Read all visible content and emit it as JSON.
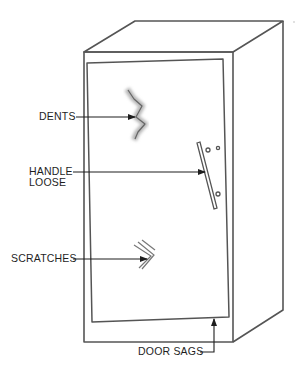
{
  "diagram": {
    "labels": {
      "dents": "DENTS",
      "handle_line1": "HANDLE",
      "handle_line2": "LOOSE",
      "scratches": "SCRATCHES",
      "door_sags": "DOOR SAGS"
    },
    "callouts": [
      {
        "id": "dents",
        "text": "DENTS",
        "target": "dent mark on upper door"
      },
      {
        "id": "handle",
        "text": "HANDLE LOOSE",
        "target": "door handle"
      },
      {
        "id": "scratches",
        "text": "SCRATCHES",
        "target": "scratch marks on lower door"
      },
      {
        "id": "door_sags",
        "text": "DOOR SAGS",
        "target": "bottom edge of door"
      }
    ],
    "colors": {
      "line": "#555555",
      "text": "#1e1e1e",
      "dent_shadow": "#b8b8b8",
      "background": "#ffffff"
    }
  }
}
